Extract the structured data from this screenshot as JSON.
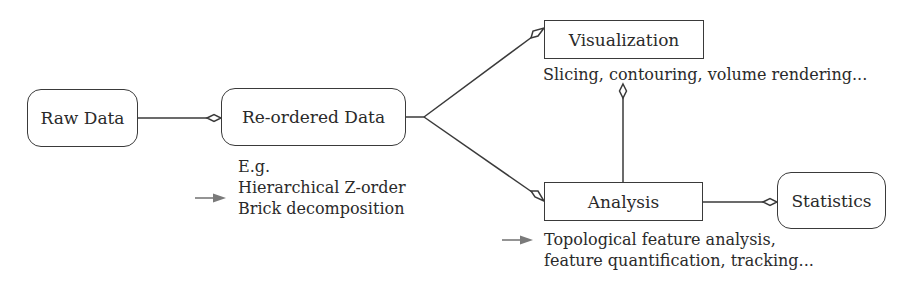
{
  "diagram": {
    "nodes": {
      "raw_data": {
        "label": "Raw Data",
        "shape": "rounded-rect"
      },
      "reordered_data": {
        "label": "Re-ordered Data",
        "shape": "rounded-rect"
      },
      "visualization": {
        "label": "Visualization",
        "shape": "rect"
      },
      "analysis": {
        "label": "Analysis",
        "shape": "rect"
      },
      "statistics": {
        "label": "Statistics",
        "shape": "rounded-rect"
      }
    },
    "annotations": {
      "reordered_examples": {
        "line1": "E.g.",
        "line2": "Hierarchical Z-order",
        "line3": "Brick decomposition"
      },
      "visualization_desc": "Slicing, contouring, volume rendering...",
      "analysis_desc": {
        "line1": "Topological feature analysis,",
        "line2": "feature quantification, tracking..."
      }
    },
    "edges": [
      {
        "from": "Raw Data",
        "to": "Re-ordered Data",
        "head": "open-diamond"
      },
      {
        "from": "Re-ordered Data",
        "to": "Visualization",
        "head": "open-diamond"
      },
      {
        "from": "Re-ordered Data",
        "to": "Analysis",
        "head": "open-diamond"
      },
      {
        "from": "Analysis",
        "to": "Visualization",
        "head": "open-diamond"
      },
      {
        "from": "Analysis",
        "to": "Statistics",
        "head": "open-diamond"
      }
    ],
    "colors": {
      "stroke": "#3a3a3a",
      "text": "#2a2a2a",
      "pointer_arrow": "#7a7a7a"
    }
  }
}
